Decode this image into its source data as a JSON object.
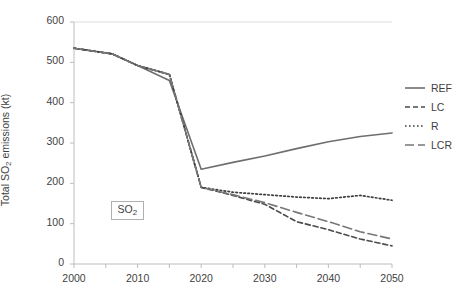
{
  "chart_data": {
    "type": "line",
    "title": "",
    "xlabel": "",
    "ylabel": "Total SO2 emissions (kt)",
    "ylabel_main": "Total SO",
    "ylabel_sub": "2",
    "ylabel_tail": " emissions (kt)",
    "xlim": [
      2000,
      2050
    ],
    "ylim": [
      0,
      600
    ],
    "ytick_step": 100,
    "xtick_step": 10,
    "grid": "top-border-only",
    "legend_position": "right",
    "annotation": {
      "text_main": "SO",
      "text_sub": "2",
      "x": 2007,
      "y": 135
    },
    "xticks": [
      "2000",
      "2010",
      "2020",
      "2030",
      "2040",
      "2050"
    ],
    "yticks": [
      "0",
      "100",
      "200",
      "300",
      "400",
      "500",
      "600"
    ],
    "x": [
      2000,
      2006,
      2010,
      2015,
      2020,
      2025,
      2030,
      2035,
      2040,
      2045,
      2050
    ],
    "series": [
      {
        "name": "REF",
        "style": "solid",
        "color": "#6e6e6e",
        "width": 1.6,
        "values": [
          535,
          521,
          492,
          455,
          235,
          252,
          268,
          286,
          303,
          316,
          325
        ]
      },
      {
        "name": "LC",
        "style": "dashed",
        "color": "#4a4a4a",
        "width": 1.6,
        "values": [
          535,
          521,
          492,
          470,
          190,
          170,
          148,
          105,
          85,
          62,
          45
        ]
      },
      {
        "name": "R",
        "style": "dotted",
        "color": "#3f3f3f",
        "width": 1.7,
        "values": [
          535,
          521,
          492,
          470,
          190,
          178,
          172,
          166,
          162,
          170,
          158
        ]
      },
      {
        "name": "LCR",
        "style": "long-dash",
        "color": "#777777",
        "width": 1.6,
        "values": [
          535,
          521,
          492,
          470,
          190,
          172,
          152,
          128,
          105,
          80,
          62
        ]
      }
    ]
  },
  "legend": {
    "items": [
      {
        "label": "REF"
      },
      {
        "label": "LC"
      },
      {
        "label": "R"
      },
      {
        "label": "LCR"
      }
    ]
  }
}
